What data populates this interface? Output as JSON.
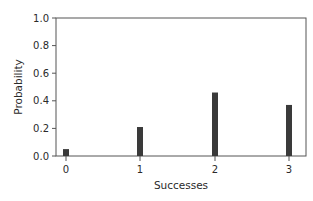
{
  "chart_data": {
    "type": "bar",
    "title": "",
    "xlabel": "Successes",
    "ylabel": "Probability",
    "categories": [
      "0",
      "1",
      "2",
      "3"
    ],
    "values": [
      0.05,
      0.21,
      0.46,
      0.37
    ],
    "ylim": [
      0.0,
      1.0
    ],
    "yticks": [
      "0.0",
      "0.2",
      "0.4",
      "0.6",
      "0.8",
      "1.0"
    ],
    "grid": false,
    "legend": null,
    "bar_color": "#3a3a3a"
  }
}
